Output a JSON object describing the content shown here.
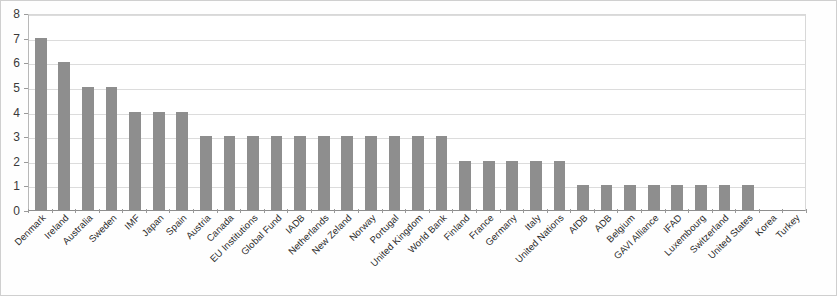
{
  "chart_data": {
    "type": "bar",
    "title": "",
    "subtitle": "",
    "xlabel": "",
    "ylabel": "",
    "ylim": [
      0,
      8
    ],
    "ytick_labels": [
      "0",
      "1",
      "2",
      "3",
      "4",
      "5",
      "6",
      "7",
      "8"
    ],
    "ytick_values": [
      0,
      1,
      2,
      3,
      4,
      5,
      6,
      7,
      8
    ],
    "grid": true,
    "legend": false,
    "legend_position": "none",
    "bar_color": "#8e8e8e",
    "gridline_color": "#dcdcdc",
    "axis_color": "#8d8d8d",
    "categories": [
      "Denmark",
      "Ireland",
      "Australia",
      "Sweden",
      "IMF",
      "Japan",
      "Spain",
      "Austria",
      "Canada",
      "EU Institutions",
      "Global Fund",
      "IADB",
      "Netherlands",
      "New Zeland",
      "Norway",
      "Portugal",
      "United Kingdom",
      "World Bank",
      "Finland",
      "France",
      "Germany",
      "Italy",
      "United Nations",
      "AfDB",
      "ADB",
      "Belgium",
      "GAVI Alliance",
      "IFAD",
      "Luxembourg",
      "Switzerland",
      "United States",
      "Korea",
      "Turkey"
    ],
    "values": [
      7,
      6,
      5,
      5,
      4,
      4,
      4,
      3,
      3,
      3,
      3,
      3,
      3,
      3,
      3,
      3,
      3,
      3,
      2,
      2,
      2,
      2,
      2,
      1,
      1,
      1,
      1,
      1,
      1,
      1,
      1,
      0,
      0
    ]
  }
}
